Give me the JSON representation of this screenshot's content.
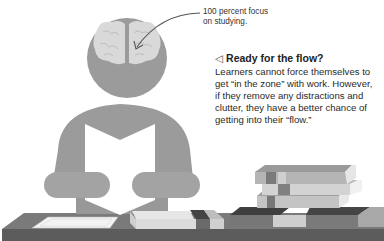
{
  "callout": {
    "caption_lines": [
      "100 percent focus",
      "on studying."
    ]
  },
  "sidebar_note": {
    "icon": "left-triangle-icon",
    "icon_glyph": "◁",
    "heading": "Ready for the flow?",
    "body_lines": [
      "Learners cannot force themselves to",
      "get “in the zone” with work. However,",
      "if they remove any distractions and",
      "clutter, they have a better chance of",
      "getting into their “flow.”"
    ]
  },
  "colors": {
    "figure": "#9b9b9b",
    "brain": "#d9d9d9",
    "desk_top": "#777777",
    "desk_front": "#5e5e5e",
    "book_light": "#cfcfcf",
    "book_mid": "#a9a9a9",
    "book_dark": "#4f4f4f"
  }
}
